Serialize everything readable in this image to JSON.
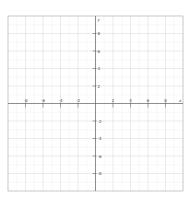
{
  "chart_data": {
    "type": "scatter",
    "title": "",
    "xlabel": "x",
    "ylabel": "y",
    "xlim": [
      -10,
      10
    ],
    "ylim": [
      -10,
      10
    ],
    "grid": true,
    "major_step": 2,
    "minor_step": 1,
    "x_ticks": [
      -8,
      -6,
      -4,
      -2,
      2,
      4,
      6,
      8
    ],
    "y_ticks": [
      8,
      6,
      4,
      2,
      -2,
      -4,
      -6,
      -8
    ],
    "x_tick_labels": [
      "-8",
      "-6",
      "-4",
      "-2",
      "2",
      "4",
      "6",
      "8"
    ],
    "y_tick_labels": [
      "8",
      "6",
      "4",
      "2",
      "-2",
      "-4",
      "-6",
      "-8"
    ],
    "series": [],
    "colors": {
      "grid_major": "#d6d6d6",
      "grid_minor": "#eeeeee",
      "axis": "#666666",
      "frame": "#bbbbbb"
    }
  }
}
